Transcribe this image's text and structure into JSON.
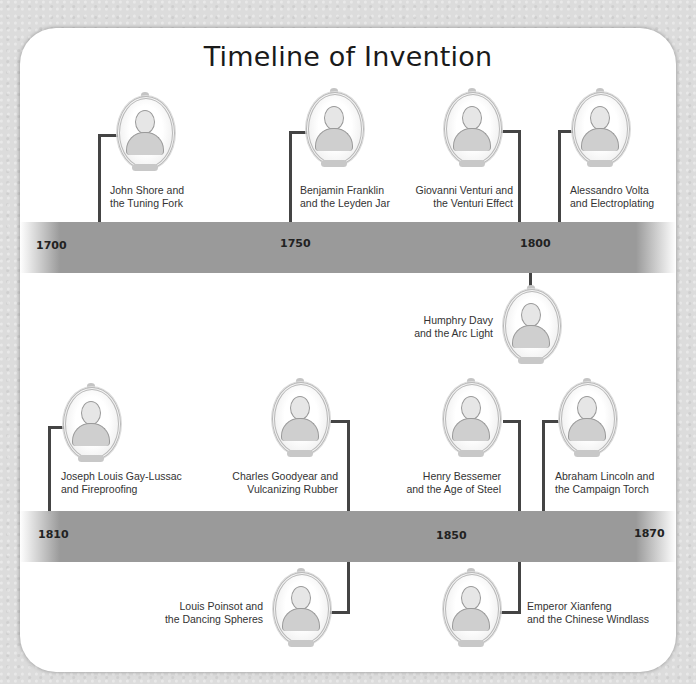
{
  "title": "Timeline of Invention",
  "timelines": [
    {
      "ticks": [
        "1700",
        "1750",
        "1800"
      ],
      "events": [
        {
          "name": "John Shore",
          "line1": "John Shore and",
          "line2": "the Tuning Fork"
        },
        {
          "name": "Benjamin Franklin",
          "line1": "Benjamin Franklin",
          "line2": "and the Leyden Jar"
        },
        {
          "name": "Giovanni Venturi",
          "line1": "Giovanni Venturi and",
          "line2": "the Venturi Effect"
        },
        {
          "name": "Alessandro Volta",
          "line1": "Alessandro Volta",
          "line2": "and Electroplating"
        },
        {
          "name": "Humphry Davy",
          "line1": "Humphry Davy",
          "line2": "and the Arc Light"
        }
      ]
    },
    {
      "ticks": [
        "1810",
        "1850",
        "1870"
      ],
      "events": [
        {
          "name": "Joseph Louis Gay-Lussac",
          "line1": "Joseph Louis Gay-Lussac",
          "line2": "and Fireproofing"
        },
        {
          "name": "Charles Goodyear",
          "line1": "Charles Goodyear and",
          "line2": "Vulcanizing Rubber"
        },
        {
          "name": "Henry Bessemer",
          "line1": "Henry Bessemer",
          "line2": "and the Age of Steel"
        },
        {
          "name": "Abraham Lincoln",
          "line1": "Abraham Lincoln and",
          "line2": "the Campaign Torch"
        },
        {
          "name": "Louis Poinsot",
          "line1": "Louis Poinsot and",
          "line2": "the Dancing Spheres"
        },
        {
          "name": "Emperor Xianfeng",
          "line1": "Emperor Xianfeng",
          "line2": "and the Chinese Windlass"
        }
      ]
    }
  ],
  "colors": {
    "band": "#9a9a9a",
    "connector": "#444444",
    "panel": "#ffffff",
    "background": "#dcdcdc"
  }
}
